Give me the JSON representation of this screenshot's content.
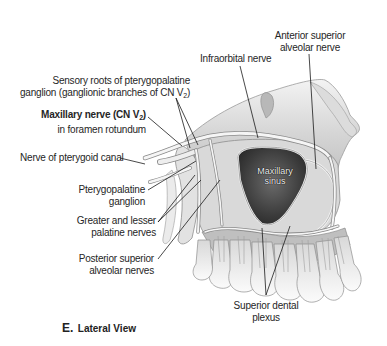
{
  "figure": {
    "caption_letter": "E.",
    "caption_text": "Lateral View"
  },
  "labels": {
    "infraorbital_nerve": "Infraorbital nerve",
    "anterior_superior_alveolar_line1": "Anterior superior",
    "anterior_superior_alveolar_line2": "alveolar nerve",
    "sensory_roots_line1": "Sensory roots of pterygopalatine",
    "sensory_roots_line2_prefix": "ganglion (ganglionic branches of CN V",
    "sensory_roots_line2_sub": "2",
    "sensory_roots_line2_suffix": ")",
    "maxillary_nerve_prefix": "Maxillary nerve (CN V",
    "maxillary_nerve_sub": "2",
    "maxillary_nerve_suffix": ")",
    "maxillary_nerve_line2": "in foramen rotundum",
    "nerve_pterygoid_canal": "Nerve of pterygoid canal",
    "pterygopalatine_ganglion_line1": "Pterygopalatine",
    "pterygopalatine_ganglion_line2": "ganglion",
    "palatine_nerves_line1": "Greater and lesser",
    "palatine_nerves_line2": "palatine nerves",
    "posterior_superior_alveolar_line1": "Posterior superior",
    "posterior_superior_alveolar_line2": "alveolar nerves",
    "superior_dental_plexus_line1": "Superior dental",
    "superior_dental_plexus_line2": "plexus",
    "maxillary_sinus_line1": "Maxillary",
    "maxillary_sinus_line2": "sinus"
  },
  "colors": {
    "bone_light": "#e8e8e8",
    "bone_mid": "#c9c9c9",
    "bone_dark": "#8e8e8e",
    "sinus_dark": "#3a3a3a",
    "nerve": "#f4f4f4",
    "leader": "#1a1a1a"
  }
}
